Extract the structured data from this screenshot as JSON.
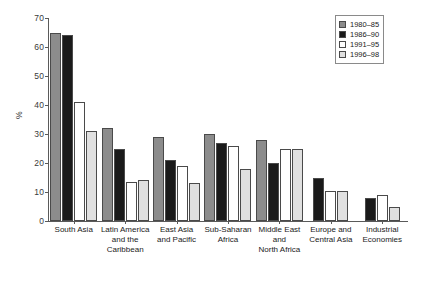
{
  "chart_data": {
    "type": "bar",
    "title": "",
    "xlabel": "",
    "ylabel": "%",
    "ylim": [
      0,
      70
    ],
    "yticks": [
      0,
      10,
      20,
      30,
      40,
      50,
      60,
      70
    ],
    "grid": false,
    "legend_position": "top-right",
    "categories": [
      "South Asia",
      "Latin America and the Caribbean",
      "East Asia and Pacific",
      "Sub-Saharan Africa",
      "Middle East and North Africa",
      "Europe and Central Asia",
      "Industrial Economies"
    ],
    "category_lines": [
      [
        "South Asia"
      ],
      [
        "Latin America",
        "and the",
        "Caribbean"
      ],
      [
        "East Asia",
        "and Pacific"
      ],
      [
        "Sub-Saharan",
        "Africa"
      ],
      [
        "Middle East",
        "and",
        "North Africa"
      ],
      [
        "Europe and",
        "Central Asia"
      ],
      [
        "Industrial",
        "Economies"
      ]
    ],
    "series": [
      {
        "name": "1980–85",
        "color": "#8c8c8c",
        "values": [
          65,
          32,
          29,
          30,
          28,
          null,
          null
        ]
      },
      {
        "name": "1986–90",
        "color": "#1a1a1a",
        "values": [
          64,
          25,
          21,
          27,
          20,
          15,
          8
        ]
      },
      {
        "name": "1991–95",
        "color": "#ffffff",
        "values": [
          41,
          13.5,
          19,
          26,
          25,
          10.5,
          9
        ]
      },
      {
        "name": "1996–98",
        "color": "#e0e0e0",
        "values": [
          31,
          14,
          13,
          18,
          25,
          10.5,
          5
        ]
      }
    ]
  }
}
